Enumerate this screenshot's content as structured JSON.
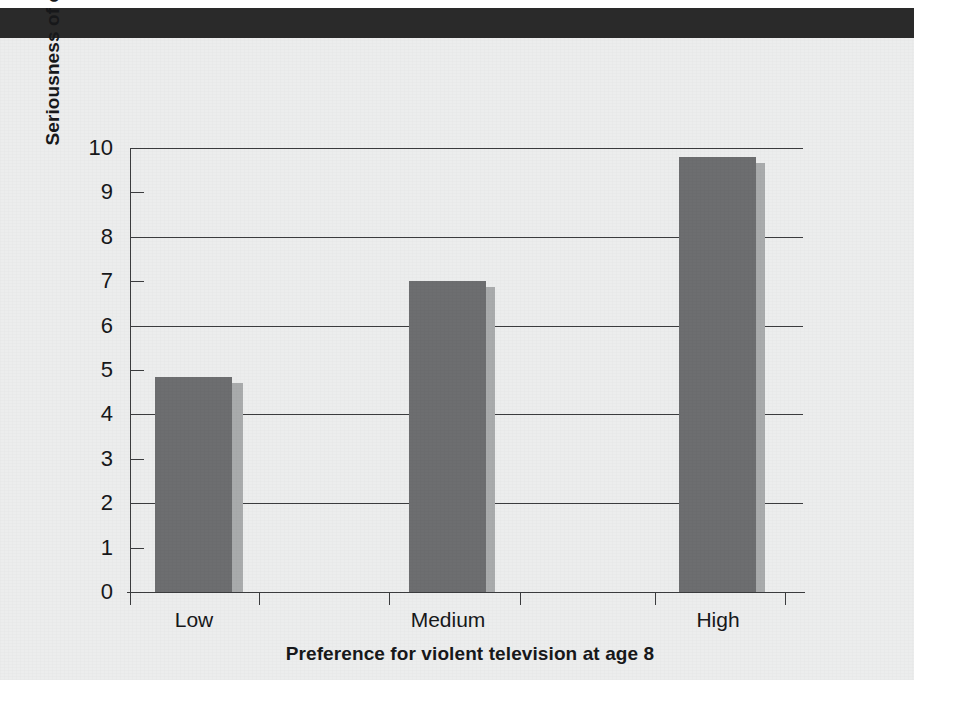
{
  "figure": {
    "background_color": "#eceded",
    "band_color": "#2a2a2a",
    "bar_color": "#6d6e70",
    "bar_shadow_color": "#a9abac",
    "axis_color": "#3b3c3e"
  },
  "chart_data": {
    "type": "bar",
    "title": "",
    "xlabel": "Preference for violent television at age 8",
    "ylabel": "Seriousness of criminal arrests by age 30",
    "categories": [
      "Low",
      "Medium",
      "High"
    ],
    "values": [
      4.85,
      7.0,
      9.8
    ],
    "ylim": [
      0,
      10
    ],
    "ytick_labels": [
      "10",
      "9",
      "8",
      "7",
      "6",
      "5",
      "4",
      "3",
      "2",
      "1",
      "0"
    ],
    "ytick_values": [
      10,
      9,
      8,
      7,
      6,
      5,
      4,
      3,
      2,
      1,
      0
    ],
    "gridline_values": [
      10,
      8,
      6,
      4,
      2,
      0
    ],
    "minor_tick_values": [
      9,
      7,
      5,
      3,
      1
    ],
    "grid": true,
    "legend": "none",
    "series": [
      {
        "name": "Seriousness of criminal arrests by age 30",
        "values": [
          4.85,
          7.0,
          9.8
        ]
      }
    ]
  }
}
